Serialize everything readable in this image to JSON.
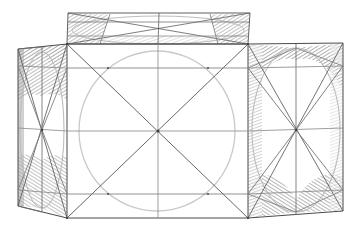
{
  "document": {
    "title": "Perspective Construction Drawing",
    "medium": "graphite pencil line drawing on white paper",
    "subject": "two-point perspective construction of a rectangular box with inscribed circle and ellipses",
    "background_color": "#ffffff",
    "canvas": {
      "width": 360,
      "height": 238
    }
  },
  "palette": {
    "line_dark": "#4a4a4a",
    "line_medium": "#6f6f6f",
    "line_light": "#9a9a9a",
    "circle_light": "#c9c9c9",
    "ellipse_light": "#bdbdbd",
    "shade_fill": "#9e9e9e",
    "shade_fill_soft": "#b5b5b5",
    "paper": "#ffffff"
  },
  "chart_data": {
    "type": "diagram",
    "vertices": {
      "top_flap_back_left": [
        68,
        13
      ],
      "top_flap_back_right": [
        250,
        13
      ],
      "top_flap_front_right": [
        248,
        44
      ],
      "top_flap_front_left": [
        67,
        44
      ],
      "front_top_left": [
        67,
        44
      ],
      "front_top_right": [
        248,
        44
      ],
      "front_bottom_right": [
        248,
        218
      ],
      "front_bottom_left": [
        67,
        218
      ],
      "left_back_top": [
        18,
        49
      ],
      "left_back_bottom": [
        18,
        206
      ],
      "right_back_top": [
        343,
        43
      ],
      "right_back_bottom": [
        343,
        211
      ]
    },
    "panels": [
      {
        "name": "top-flap",
        "shape": "trapezoid",
        "points": "68,13 250,13 248,44 67,44",
        "features": [
          "full-diagonals",
          "vertical-center-line",
          "flattened-ellipse",
          "horizontal-quarter-line"
        ]
      },
      {
        "name": "front-face",
        "shape": "rectangle",
        "points": "67,44 248,44 248,218 67,218",
        "features": [
          "inscribed-circle",
          "full-diagonals",
          "vertical-center-line",
          "horizontal-center-line",
          "upper-horizontal-line",
          "lower-horizontal-line",
          "corner-to-mid-diagonals"
        ]
      },
      {
        "name": "left-side-panel",
        "shape": "quadrilateral",
        "points": "18,49 67,44 67,218 18,206",
        "features": [
          "inscribed-ellipse",
          "full-diagonals",
          "vertical-center-line",
          "horizontal-center-line",
          "upper-horizontal-line",
          "lower-horizontal-line",
          "hatched-corner-bays"
        ]
      },
      {
        "name": "right-side-panel",
        "shape": "quadrilateral",
        "points": "248,44 343,43 343,211 248,218",
        "features": [
          "inscribed-ellipse",
          "full-diagonals",
          "vertical-center-line",
          "horizontal-center-line",
          "upper-horizontal-line",
          "lower-horizontal-line",
          "hatched-corner-bays"
        ]
      }
    ],
    "inscribed_shapes": [
      {
        "name": "front-circle",
        "type": "ellipse",
        "cx": 157,
        "cy": 131,
        "rx": 78,
        "ry": 80,
        "stroke": "#c9c9c9"
      },
      {
        "name": "left-ellipse",
        "type": "ellipse",
        "cx": 42,
        "cy": 130,
        "rx": 22,
        "ry": 78,
        "stroke": "#bdbdbd"
      },
      {
        "name": "right-ellipse",
        "type": "ellipse",
        "cx": 296,
        "cy": 130,
        "rx": 44,
        "ry": 82,
        "stroke": "#bdbdbd"
      },
      {
        "name": "top-flap-ellipse",
        "type": "ellipse",
        "cx": 158,
        "cy": 30,
        "rx": 86,
        "ry": 14,
        "stroke": "#bdbdbd"
      }
    ],
    "shaded_regions": [
      "left-panel-top-left-bay",
      "left-panel-top-right-bay",
      "left-panel-bottom-left-bay",
      "left-panel-bottom-right-bay",
      "right-panel-top-left-bay",
      "right-panel-top-right-bay",
      "right-panel-bottom-left-bay",
      "right-panel-bottom-right-bay",
      "top-flap-left-bay",
      "top-flap-right-bay"
    ]
  }
}
